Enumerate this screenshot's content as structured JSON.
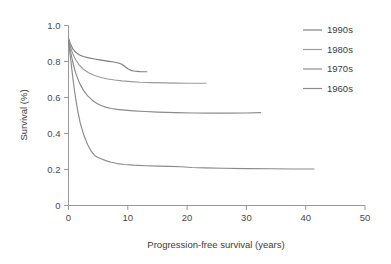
{
  "chart_data": {
    "type": "line",
    "title": "",
    "xlabel": "Progression-free survival (years)",
    "ylabel": "Survival (%)",
    "xlim": [
      0,
      50
    ],
    "ylim": [
      0,
      1.0
    ],
    "xticks": [
      "0",
      "10",
      "20",
      "30",
      "40",
      "50"
    ],
    "xtick_values": [
      0,
      10,
      20,
      30,
      40,
      50
    ],
    "yticks": [
      "0",
      "0.2",
      "0.4",
      "0.6",
      "0.8",
      "1.0"
    ],
    "ytick_values": [
      0,
      0.2,
      0.4,
      0.6,
      0.8,
      1.0
    ],
    "grid": false,
    "legend_position": "top-right",
    "series": [
      {
        "name": "1990s",
        "color": "#7d7d7d",
        "points": [
          [
            0,
            0.93
          ],
          [
            0.3,
            0.9
          ],
          [
            0.7,
            0.872
          ],
          [
            1.2,
            0.852
          ],
          [
            1.8,
            0.838
          ],
          [
            2.5,
            0.828
          ],
          [
            3.4,
            0.82
          ],
          [
            4.4,
            0.814
          ],
          [
            5.5,
            0.808
          ],
          [
            6.6,
            0.802
          ],
          [
            7.6,
            0.797
          ],
          [
            8.4,
            0.792
          ],
          [
            9.0,
            0.785
          ],
          [
            9.5,
            0.772
          ],
          [
            10.0,
            0.76
          ],
          [
            10.5,
            0.751
          ],
          [
            11.0,
            0.747
          ],
          [
            12.0,
            0.744
          ],
          [
            13.2,
            0.743
          ]
        ]
      },
      {
        "name": "1980s",
        "color": "#9a9a9a",
        "points": [
          [
            0,
            0.93
          ],
          [
            0.3,
            0.885
          ],
          [
            0.7,
            0.845
          ],
          [
            1.2,
            0.81
          ],
          [
            1.8,
            0.781
          ],
          [
            2.5,
            0.757
          ],
          [
            3.4,
            0.737
          ],
          [
            4.4,
            0.722
          ],
          [
            5.5,
            0.711
          ],
          [
            6.6,
            0.703
          ],
          [
            7.8,
            0.697
          ],
          [
            9.0,
            0.692
          ],
          [
            10.5,
            0.688
          ],
          [
            12.0,
            0.685
          ],
          [
            14.0,
            0.683
          ],
          [
            16.0,
            0.681
          ],
          [
            18.0,
            0.68
          ],
          [
            20.0,
            0.679
          ],
          [
            22.0,
            0.679
          ],
          [
            23.2,
            0.679
          ]
        ]
      },
      {
        "name": "1970s",
        "color": "#8a8a8a",
        "points": [
          [
            0,
            0.92
          ],
          [
            0.3,
            0.862
          ],
          [
            0.7,
            0.8
          ],
          [
            1.2,
            0.737
          ],
          [
            1.8,
            0.684
          ],
          [
            2.5,
            0.641
          ],
          [
            3.2,
            0.61
          ],
          [
            4.0,
            0.585
          ],
          [
            4.8,
            0.567
          ],
          [
            5.6,
            0.554
          ],
          [
            6.4,
            0.545
          ],
          [
            7.2,
            0.539
          ],
          [
            8.2,
            0.534
          ],
          [
            9.5,
            0.53
          ],
          [
            11.0,
            0.526
          ],
          [
            13.0,
            0.522
          ],
          [
            15.0,
            0.519
          ],
          [
            18.0,
            0.516
          ],
          [
            21.0,
            0.514
          ],
          [
            24.0,
            0.513
          ],
          [
            27.0,
            0.513
          ],
          [
            30.0,
            0.514
          ],
          [
            32.4,
            0.516
          ]
        ]
      },
      {
        "name": "1960s",
        "color": "#8a8a8a",
        "points": [
          [
            0,
            0.915
          ],
          [
            0.25,
            0.845
          ],
          [
            0.6,
            0.745
          ],
          [
            1.0,
            0.64
          ],
          [
            1.5,
            0.535
          ],
          [
            2.0,
            0.455
          ],
          [
            2.6,
            0.39
          ],
          [
            3.2,
            0.34
          ],
          [
            3.8,
            0.303
          ],
          [
            4.4,
            0.278
          ],
          [
            4.9,
            0.268
          ],
          [
            5.6,
            0.258
          ],
          [
            6.4,
            0.248
          ],
          [
            7.2,
            0.24
          ],
          [
            8.2,
            0.233
          ],
          [
            9.4,
            0.228
          ],
          [
            11.0,
            0.224
          ],
          [
            13.0,
            0.221
          ],
          [
            15.0,
            0.219
          ],
          [
            17.0,
            0.217
          ],
          [
            19.0,
            0.215
          ],
          [
            20.8,
            0.211
          ],
          [
            23.0,
            0.209
          ],
          [
            26.0,
            0.207
          ],
          [
            30.0,
            0.205
          ],
          [
            34.0,
            0.204
          ],
          [
            38.0,
            0.203
          ],
          [
            41.4,
            0.203
          ]
        ]
      }
    ]
  },
  "legend": {
    "items": [
      {
        "label": "1990s"
      },
      {
        "label": "1980s"
      },
      {
        "label": "1970s"
      },
      {
        "label": "1960s"
      }
    ]
  }
}
